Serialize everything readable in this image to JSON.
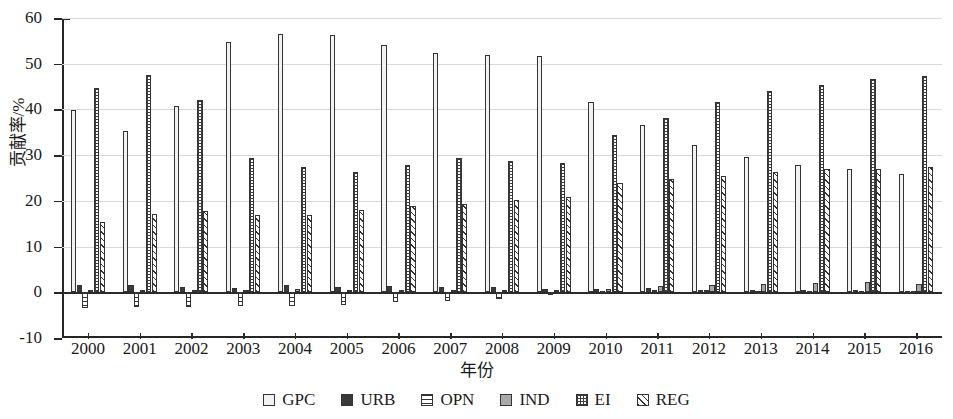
{
  "chart_data": {
    "type": "bar",
    "title": "",
    "xlabel": "年份",
    "ylabel": "贡献率/%",
    "ylim": [
      -10,
      60
    ],
    "yticks": [
      -10,
      0,
      10,
      20,
      30,
      40,
      50,
      60
    ],
    "ytick_labels": [
      "-10",
      "0",
      "10",
      "20",
      "30",
      "40",
      "50",
      "60"
    ],
    "grid": true,
    "legend_position": "bottom",
    "categories": [
      "2000",
      "2001",
      "2002",
      "2003",
      "2004",
      "2005",
      "2006",
      "2007",
      "2008",
      "2009",
      "2010",
      "2011",
      "2012",
      "2013",
      "2014",
      "2015",
      "2016"
    ],
    "series": [
      {
        "name": "GPC",
        "pattern": "solid-light",
        "color": "#f2f2f2",
        "values": [
          39.8,
          35.2,
          40.7,
          54.8,
          56.5,
          56.2,
          54.2,
          52.4,
          52.0,
          51.7,
          41.6,
          36.7,
          32.2,
          29.5,
          27.9,
          27.0,
          25.9
        ]
      },
      {
        "name": "URB",
        "pattern": "solid-dark",
        "color": "#3a3a3a",
        "values": [
          1.6,
          1.5,
          1.2,
          1.0,
          1.5,
          1.2,
          1.4,
          1.2,
          1.2,
          0.8,
          0.7,
          0.9,
          0.6,
          0.5,
          0.4,
          0.4,
          0.3
        ]
      },
      {
        "name": "OPN",
        "pattern": "horizontal-lines",
        "color": "#ffffff",
        "values": [
          -3.4,
          -3.2,
          -3.2,
          -3.0,
          -3.1,
          -2.7,
          -2.1,
          -2.0,
          -1.5,
          -0.5,
          0.3,
          0.5,
          0.4,
          0.3,
          0.2,
          0.2,
          0.2
        ]
      },
      {
        "name": "IND",
        "pattern": "solid-gray",
        "color": "#a8a8a8",
        "values": [
          0.4,
          0.5,
          0.5,
          0.6,
          0.7,
          0.6,
          0.6,
          0.6,
          0.6,
          0.5,
          0.7,
          1.4,
          1.5,
          1.9,
          2.0,
          2.2,
          1.8
        ]
      },
      {
        "name": "EI",
        "pattern": "cross-dot",
        "color": "#ffffff",
        "values": [
          44.6,
          47.6,
          42.1,
          29.3,
          27.5,
          26.4,
          27.8,
          29.4,
          28.7,
          28.2,
          34.4,
          38.2,
          41.6,
          44.1,
          45.4,
          46.6,
          47.4
        ]
      },
      {
        "name": "REG",
        "pattern": "diagonal-lines",
        "color": "#ffffff",
        "values": [
          15.4,
          17.2,
          17.7,
          16.9,
          16.9,
          18.1,
          18.8,
          19.4,
          20.2,
          20.8,
          24.0,
          24.8,
          25.5,
          26.4,
          27.0,
          27.0,
          27.5
        ]
      }
    ]
  },
  "legend": {
    "items": [
      {
        "label": "GPC",
        "key": "gpc"
      },
      {
        "label": "URB",
        "key": "urb"
      },
      {
        "label": "OPN",
        "key": "opn"
      },
      {
        "label": "IND",
        "key": "ind"
      },
      {
        "label": "EI",
        "key": "ei"
      },
      {
        "label": "REG",
        "key": "reg"
      }
    ]
  }
}
